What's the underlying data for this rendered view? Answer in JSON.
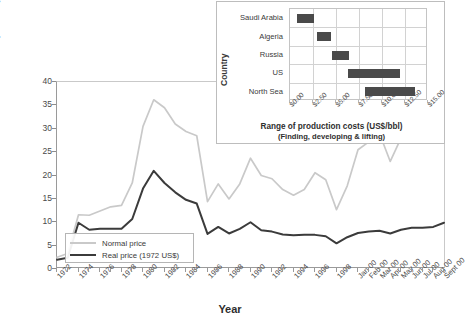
{
  "chart_data": [
    {
      "type": "line",
      "title": "",
      "xlabel": "Year",
      "ylabel": "Crude oil prices (US$/bbl)",
      "ylim": [
        0,
        40
      ],
      "yticks": [
        0,
        5,
        10,
        15,
        20,
        25,
        30,
        35,
        40
      ],
      "grid": false,
      "legend_position": "inside-bottom-left",
      "categories": [
        "1972",
        "1973",
        "1974",
        "1975",
        "1976",
        "1977",
        "1978",
        "1979",
        "1980",
        "1981",
        "1982",
        "1983",
        "1984",
        "1985",
        "1986",
        "1987",
        "1988",
        "1989",
        "1990",
        "1991",
        "1992",
        "1993",
        "1994",
        "1995",
        "1996",
        "1997",
        "1998",
        "1999",
        "Jan 00",
        "Feb 00",
        "Mar 00",
        "Apr 00",
        "May 00",
        "Jun 00",
        "Jul 00",
        "Aug 00",
        "Sept 00"
      ],
      "series": [
        {
          "name": "Normal price",
          "color": "#c9c9c9",
          "values": [
            2.5,
            3.3,
            11.6,
            11.5,
            12.4,
            13.3,
            13.6,
            18.4,
            30.5,
            36.2,
            34.5,
            31.0,
            29.4,
            28.5,
            14.4,
            18.2,
            15.0,
            18.2,
            23.7,
            20.0,
            19.3,
            17.0,
            15.8,
            17.0,
            20.6,
            19.1,
            12.7,
            17.8,
            25.5,
            27.2,
            29.0,
            23.0,
            28.0,
            31.0,
            29.5,
            31.0,
            33.0
          ]
        },
        {
          "name": "Real price (1972 US$)",
          "color": "#3b3b3b",
          "values": [
            2.0,
            2.4,
            9.9,
            8.4,
            8.6,
            8.6,
            8.6,
            10.7,
            17.2,
            21.0,
            18.4,
            16.4,
            14.8,
            14.0,
            7.5,
            9.0,
            7.6,
            8.6,
            10.0,
            8.3,
            8.0,
            7.4,
            7.2,
            7.3,
            7.3,
            7.0,
            5.5,
            6.8,
            7.7,
            8.0,
            8.2,
            7.6,
            8.4,
            8.8,
            8.8,
            9.0,
            9.9
          ]
        }
      ],
      "xtick_labels": [
        "1972",
        "1974",
        "1976",
        "1978",
        "1980",
        "1982",
        "1984",
        "1986",
        "1988",
        "1990",
        "1992",
        "1994",
        "1996",
        "1998",
        "Jan 00",
        "Feb 00",
        "Mar 00",
        "Apr 00",
        "May 00",
        "Jun 00",
        "Jul 00",
        "Aug 00",
        "Sept 00"
      ]
    },
    {
      "type": "bar",
      "orientation": "horizontal-range",
      "title": "Range of production costs (US$/bbl)",
      "subtitle": "(Finding, developing & lifting)",
      "xlabel": "",
      "ylabel": "Country",
      "xlim": [
        0,
        15
      ],
      "xticks": [
        0,
        2.5,
        5,
        7.5,
        10,
        12.5,
        15
      ],
      "xtick_labels": [
        "$0.00",
        "$2.50",
        "$5.00",
        "$7.50",
        "$10.00",
        "$12.50",
        "$15.00"
      ],
      "grid": true,
      "categories": [
        "Saudi Arabia",
        "Algeria",
        "Russia",
        "US",
        "North Sea"
      ],
      "ranges": [
        {
          "category": "Saudi Arabia",
          "low": 0.8,
          "high": 2.6
        },
        {
          "category": "Algeria",
          "low": 2.9,
          "high": 4.5
        },
        {
          "category": "Russia",
          "low": 4.6,
          "high": 6.4
        },
        {
          "category": "US",
          "low": 6.3,
          "high": 12.0
        },
        {
          "category": "North Sea",
          "low": 8.1,
          "high": 13.6
        }
      ],
      "bar_color": "#4a4a4a"
    }
  ],
  "main_chart": {
    "ylabel": "Crude oil prices (US$/bbl)",
    "xlabel": "Year",
    "legend": {
      "normal_label": "Normal price",
      "real_label": "Real price (1972 US$)"
    }
  },
  "inset_chart": {
    "ylabel": "Country",
    "title": "Range of production costs (US$/bbl)",
    "subtitle": "(Finding, developing & lifting)"
  }
}
